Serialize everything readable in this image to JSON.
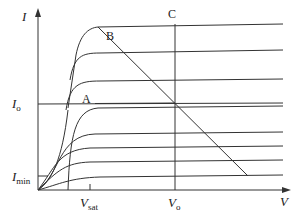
{
  "diagram": {
    "type": "transistor output characteristics with load line",
    "axes": {
      "y_label": "I",
      "x_label": "V"
    },
    "points": {
      "A": "A",
      "B": "B",
      "C": "C"
    },
    "y_ticks": [
      {
        "main": "I",
        "sub": "o"
      },
      {
        "main": "I",
        "sub": "min"
      }
    ],
    "x_ticks": [
      {
        "main": "V",
        "sub": "sat"
      },
      {
        "main": "V",
        "sub": "o"
      }
    ],
    "curve_count": 9,
    "colors": {
      "line": "#333333",
      "background": "#ffffff"
    }
  }
}
